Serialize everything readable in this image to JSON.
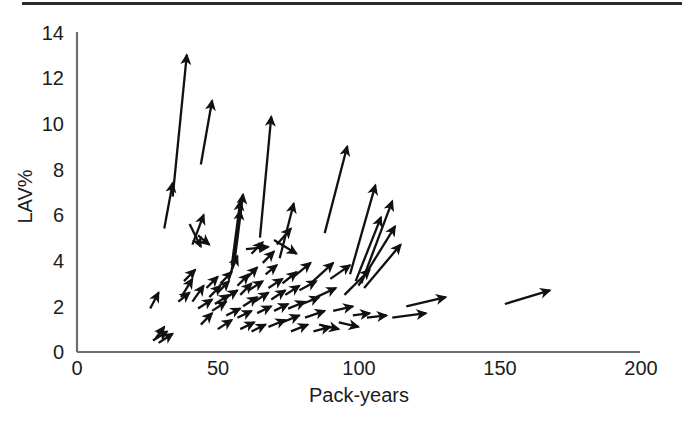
{
  "figure": {
    "has_top_rule": true,
    "background_color": "#ffffff",
    "ink_color": "#111111",
    "axis_color": "#6e6e6e"
  },
  "chart_data": {
    "type": "scatter",
    "title": "",
    "xlabel": "Pack-years",
    "ylabel": "LAV%",
    "xlim": [
      0,
      200
    ],
    "ylim": [
      0,
      14
    ],
    "xticks": [
      0,
      50,
      100,
      150,
      200
    ],
    "yticks": [
      0,
      2,
      4,
      6,
      8,
      10,
      12,
      14
    ],
    "xtick_labels": [
      "0",
      "50",
      "100",
      "150",
      "200"
    ],
    "ytick_labels": [
      "0",
      "2",
      "4",
      "6",
      "8",
      "10",
      "12",
      "14"
    ],
    "grid": false,
    "legend": null,
    "marker_style": "arrow",
    "series": [
      {
        "name": "LAV% change vectors",
        "arrows": [
          {
            "x0": 28,
            "y0": 0.6,
            "x1": 31,
            "y1": 1.1
          },
          {
            "x0": 27,
            "y0": 0.5,
            "x1": 32,
            "y1": 0.9
          },
          {
            "x0": 29,
            "y0": 0.4,
            "x1": 34,
            "y1": 0.8
          },
          {
            "x0": 26,
            "y0": 1.9,
            "x1": 29,
            "y1": 2.6
          },
          {
            "x0": 34,
            "y0": 6.8,
            "x1": 39,
            "y1": 13.0
          },
          {
            "x0": 31,
            "y0": 5.4,
            "x1": 34,
            "y1": 7.4
          },
          {
            "x0": 37,
            "y0": 2.4,
            "x1": 41,
            "y1": 3.2
          },
          {
            "x0": 36,
            "y0": 2.2,
            "x1": 40,
            "y1": 2.6
          },
          {
            "x0": 38,
            "y0": 3.1,
            "x1": 42,
            "y1": 3.6
          },
          {
            "x0": 40,
            "y0": 5.6,
            "x1": 44,
            "y1": 4.6
          },
          {
            "x0": 41,
            "y0": 4.7,
            "x1": 45,
            "y1": 6.0
          },
          {
            "x0": 43,
            "y0": 5.1,
            "x1": 47,
            "y1": 4.7
          },
          {
            "x0": 44,
            "y0": 8.2,
            "x1": 48,
            "y1": 11.0
          },
          {
            "x0": 41,
            "y0": 2.2,
            "x1": 45,
            "y1": 2.9
          },
          {
            "x0": 43,
            "y0": 1.9,
            "x1": 48,
            "y1": 2.3
          },
          {
            "x0": 44,
            "y0": 1.2,
            "x1": 48,
            "y1": 1.7
          },
          {
            "x0": 46,
            "y0": 2.8,
            "x1": 50,
            "y1": 3.3
          },
          {
            "x0": 47,
            "y0": 2.4,
            "x1": 51,
            "y1": 2.9
          },
          {
            "x0": 48,
            "y0": 1.8,
            "x1": 53,
            "y1": 2.2
          },
          {
            "x0": 49,
            "y0": 2.1,
            "x1": 54,
            "y1": 2.5
          },
          {
            "x0": 50,
            "y0": 2.6,
            "x1": 54,
            "y1": 3.1
          },
          {
            "x0": 51,
            "y0": 3.0,
            "x1": 55,
            "y1": 3.5
          },
          {
            "x0": 52,
            "y0": 2.3,
            "x1": 57,
            "y1": 2.7
          },
          {
            "x0": 53,
            "y0": 1.6,
            "x1": 58,
            "y1": 1.9
          },
          {
            "x0": 50,
            "y0": 1.0,
            "x1": 55,
            "y1": 1.4
          },
          {
            "x0": 54,
            "y0": 3.3,
            "x1": 57,
            "y1": 4.2
          },
          {
            "x0": 55,
            "y0": 3.8,
            "x1": 58,
            "y1": 6.6
          },
          {
            "x0": 55,
            "y0": 3.6,
            "x1": 58,
            "y1": 6.2
          },
          {
            "x0": 56,
            "y0": 4.0,
            "x1": 59,
            "y1": 6.9
          },
          {
            "x0": 57,
            "y0": 2.9,
            "x1": 61,
            "y1": 3.4
          },
          {
            "x0": 58,
            "y0": 2.5,
            "x1": 62,
            "y1": 3.0
          },
          {
            "x0": 59,
            "y0": 2.0,
            "x1": 64,
            "y1": 2.4
          },
          {
            "x0": 57,
            "y0": 1.5,
            "x1": 62,
            "y1": 1.8
          },
          {
            "x0": 58,
            "y0": 1.0,
            "x1": 63,
            "y1": 1.3
          },
          {
            "x0": 60,
            "y0": 3.2,
            "x1": 64,
            "y1": 3.7
          },
          {
            "x0": 61,
            "y0": 2.7,
            "x1": 66,
            "y1": 3.1
          },
          {
            "x0": 62,
            "y0": 4.3,
            "x1": 66,
            "y1": 4.8
          },
          {
            "x0": 60,
            "y0": 4.5,
            "x1": 68,
            "y1": 4.6
          },
          {
            "x0": 63,
            "y0": 2.2,
            "x1": 68,
            "y1": 2.6
          },
          {
            "x0": 64,
            "y0": 1.7,
            "x1": 69,
            "y1": 2.0
          },
          {
            "x0": 62,
            "y0": 0.9,
            "x1": 67,
            "y1": 1.2
          },
          {
            "x0": 65,
            "y0": 5.0,
            "x1": 69,
            "y1": 10.3
          },
          {
            "x0": 66,
            "y0": 3.9,
            "x1": 70,
            "y1": 4.4
          },
          {
            "x0": 67,
            "y0": 3.4,
            "x1": 71,
            "y1": 3.8
          },
          {
            "x0": 68,
            "y0": 2.8,
            "x1": 73,
            "y1": 3.2
          },
          {
            "x0": 69,
            "y0": 2.3,
            "x1": 74,
            "y1": 2.7
          },
          {
            "x0": 70,
            "y0": 1.8,
            "x1": 75,
            "y1": 2.1
          },
          {
            "x0": 68,
            "y0": 1.1,
            "x1": 74,
            "y1": 1.4
          },
          {
            "x0": 71,
            "y0": 4.7,
            "x1": 76,
            "y1": 5.4
          },
          {
            "x0": 72,
            "y0": 4.1,
            "x1": 77,
            "y1": 6.5
          },
          {
            "x0": 70,
            "y0": 4.9,
            "x1": 78,
            "y1": 4.3
          },
          {
            "x0": 73,
            "y0": 3.0,
            "x1": 78,
            "y1": 3.5
          },
          {
            "x0": 74,
            "y0": 2.5,
            "x1": 79,
            "y1": 2.9
          },
          {
            "x0": 75,
            "y0": 1.9,
            "x1": 81,
            "y1": 2.2
          },
          {
            "x0": 73,
            "y0": 1.3,
            "x1": 79,
            "y1": 1.6
          },
          {
            "x0": 76,
            "y0": 0.9,
            "x1": 82,
            "y1": 1.2
          },
          {
            "x0": 77,
            "y0": 3.3,
            "x1": 83,
            "y1": 3.9
          },
          {
            "x0": 79,
            "y0": 2.7,
            "x1": 85,
            "y1": 3.1
          },
          {
            "x0": 80,
            "y0": 2.1,
            "x1": 86,
            "y1": 2.4
          },
          {
            "x0": 81,
            "y0": 1.5,
            "x1": 88,
            "y1": 1.8
          },
          {
            "x0": 83,
            "y0": 3.0,
            "x1": 91,
            "y1": 3.9
          },
          {
            "x0": 85,
            "y0": 2.4,
            "x1": 92,
            "y1": 2.8
          },
          {
            "x0": 86,
            "y0": 1.2,
            "x1": 93,
            "y1": 1.0
          },
          {
            "x0": 84,
            "y0": 0.9,
            "x1": 90,
            "y1": 1.1
          },
          {
            "x0": 88,
            "y0": 5.2,
            "x1": 96,
            "y1": 9.0
          },
          {
            "x0": 90,
            "y0": 3.2,
            "x1": 97,
            "y1": 3.8
          },
          {
            "x0": 91,
            "y0": 1.8,
            "x1": 98,
            "y1": 2.0
          },
          {
            "x0": 93,
            "y0": 1.3,
            "x1": 100,
            "y1": 1.1
          },
          {
            "x0": 95,
            "y0": 2.5,
            "x1": 104,
            "y1": 3.6
          },
          {
            "x0": 97,
            "y0": 3.4,
            "x1": 106,
            "y1": 7.3
          },
          {
            "x0": 99,
            "y0": 3.1,
            "x1": 108,
            "y1": 5.9
          },
          {
            "x0": 101,
            "y0": 3.0,
            "x1": 112,
            "y1": 6.6
          },
          {
            "x0": 100,
            "y0": 2.9,
            "x1": 113,
            "y1": 5.5
          },
          {
            "x0": 102,
            "y0": 2.8,
            "x1": 115,
            "y1": 4.7
          },
          {
            "x0": 98,
            "y0": 1.6,
            "x1": 104,
            "y1": 1.7
          },
          {
            "x0": 103,
            "y0": 1.5,
            "x1": 110,
            "y1": 1.6
          },
          {
            "x0": 112,
            "y0": 1.5,
            "x1": 124,
            "y1": 1.7
          },
          {
            "x0": 117,
            "y0": 2.0,
            "x1": 131,
            "y1": 2.4
          },
          {
            "x0": 152,
            "y0": 2.1,
            "x1": 168,
            "y1": 2.7
          }
        ]
      }
    ]
  },
  "axes": {
    "x_title": "Pack-years",
    "y_title": "LAV%"
  }
}
